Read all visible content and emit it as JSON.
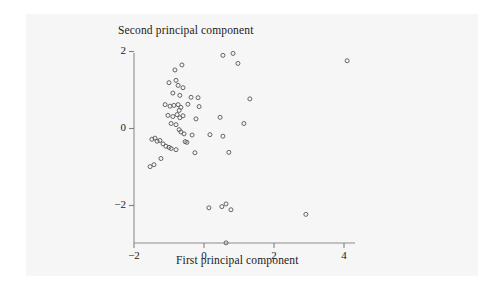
{
  "figure": {
    "background_color": "#ffffff",
    "panel_color": "#f6f6f6",
    "axis_color": "#808080",
    "marker_color": "#555555",
    "text_color": "#1a1a1a"
  },
  "chart_data": {
    "type": "scatter",
    "title": "",
    "xlabel": "First principal component",
    "ylabel": "Second principal component",
    "xlim": [
      -2.0,
      4.45
    ],
    "ylim": [
      -3.15,
      2.05
    ],
    "xticks": [
      -2,
      0,
      2,
      4
    ],
    "xticklabels": [
      "−2",
      "0",
      "2",
      "4"
    ],
    "yticks": [
      2,
      0,
      -2
    ],
    "yticklabels": [
      "2",
      "0",
      "−2"
    ],
    "grid": false,
    "legend": null,
    "marker": "open-circle",
    "marker_size": 4,
    "n_points": 61,
    "points": [
      [
        4.09,
        1.76
      ],
      [
        0.54,
        1.9
      ],
      [
        0.83,
        1.95
      ],
      [
        0.97,
        1.69
      ],
      [
        -0.63,
        1.65
      ],
      [
        -0.83,
        1.52
      ],
      [
        -1.0,
        1.19
      ],
      [
        -0.8,
        1.25
      ],
      [
        -0.74,
        1.12
      ],
      [
        -0.6,
        1.06
      ],
      [
        -0.89,
        0.92
      ],
      [
        -0.69,
        0.86
      ],
      [
        -0.37,
        0.81
      ],
      [
        -0.17,
        0.8
      ],
      [
        1.31,
        0.77
      ],
      [
        -1.11,
        0.62
      ],
      [
        -0.97,
        0.58
      ],
      [
        -0.86,
        0.6
      ],
      [
        -0.74,
        0.62
      ],
      [
        -0.66,
        0.55
      ],
      [
        -0.71,
        0.47
      ],
      [
        -0.46,
        0.63
      ],
      [
        -0.14,
        0.57
      ],
      [
        -1.03,
        0.34
      ],
      [
        -0.89,
        0.31
      ],
      [
        -0.77,
        0.36
      ],
      [
        -0.69,
        0.28
      ],
      [
        -0.6,
        0.33
      ],
      [
        -0.23,
        0.25
      ],
      [
        0.46,
        0.29
      ],
      [
        -0.94,
        0.13
      ],
      [
        -0.8,
        0.1
      ],
      [
        1.14,
        0.13
      ],
      [
        -0.71,
        -0.03
      ],
      [
        -0.66,
        -0.09
      ],
      [
        -0.57,
        -0.14
      ],
      [
        -0.34,
        -0.17
      ],
      [
        0.17,
        -0.16
      ],
      [
        0.54,
        -0.2
      ],
      [
        -1.49,
        -0.28
      ],
      [
        -1.4,
        -0.25
      ],
      [
        -1.34,
        -0.33
      ],
      [
        -1.26,
        -0.31
      ],
      [
        -1.17,
        -0.4
      ],
      [
        -0.54,
        -0.34
      ],
      [
        -0.49,
        -0.36
      ],
      [
        -1.09,
        -0.46
      ],
      [
        -1.0,
        -0.49
      ],
      [
        -0.94,
        -0.52
      ],
      [
        -0.8,
        -0.55
      ],
      [
        -0.26,
        -0.63
      ],
      [
        0.71,
        -0.62
      ],
      [
        -1.23,
        -0.78
      ],
      [
        -1.43,
        -0.94
      ],
      [
        -1.54,
        -0.99
      ],
      [
        0.14,
        -2.06
      ],
      [
        0.51,
        -2.03
      ],
      [
        0.63,
        -1.96
      ],
      [
        0.77,
        -2.11
      ],
      [
        2.91,
        -2.23
      ],
      [
        0.63,
        -2.97
      ]
    ]
  },
  "axes": {
    "x_axis_title": "First principal component",
    "y_axis_title": "Second principal component",
    "x_tick_labels": [
      "−2",
      "0",
      "2",
      "4"
    ],
    "y_tick_labels": [
      "2",
      "0",
      "−2"
    ]
  }
}
